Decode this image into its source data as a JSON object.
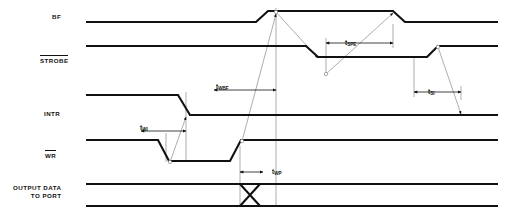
{
  "diagram": {
    "kind": "timing-diagram",
    "title": "",
    "width": 508,
    "height": 218,
    "colors": {
      "signal": "#111111",
      "reference": "#8a8a8a",
      "background": "#ffffff"
    },
    "signals": [
      {
        "id": "bf",
        "label": "BF",
        "overbar": false,
        "label_x": 52,
        "label_y": 13,
        "baseline": 22,
        "high": 11
      },
      {
        "id": "strobe",
        "label": "STROBE",
        "overbar": true,
        "label_x": 40,
        "label_y": 55,
        "baseline": 46,
        "high": 46
      },
      {
        "id": "intr",
        "label": "INTR",
        "overbar": false,
        "label_x": 44,
        "label_y": 110,
        "baseline": 115,
        "high": 95
      },
      {
        "id": "wr",
        "label": "WR",
        "overbar": true,
        "label_x": 45,
        "label_y": 150,
        "baseline": 140,
        "high": 140
      },
      {
        "id": "data",
        "label": "OUTPUT DATA\nTO PORT",
        "overbar": false,
        "label_x": 13,
        "label_y": 184,
        "baseline": 196,
        "high": 184
      }
    ],
    "timing_marks": [
      {
        "id": "t-wi",
        "text": "t",
        "sub": "WI",
        "x": 140,
        "y": 124,
        "arrow_x1": 141,
        "arrow_x2": 186,
        "arrow_y": 131
      },
      {
        "id": "t-wbf",
        "text": "t",
        "sub": "WBF",
        "x": 216,
        "y": 83,
        "arrow_x1": 214,
        "arrow_x2": 276,
        "arrow_y": 90
      },
      {
        "id": "t-spe",
        "text": "t",
        "sub": "SPE",
        "x": 345,
        "y": 39,
        "arrow_x1": 326,
        "arrow_x2": 393,
        "arrow_y": 43
      },
      {
        "id": "t-si",
        "text": "t",
        "sub": "SI",
        "x": 428,
        "y": 88,
        "arrow_x1": 414,
        "arrow_x2": 461,
        "arrow_y": 92
      },
      {
        "id": "t-wp",
        "text": "t",
        "sub": "WP",
        "x": 272,
        "y": 168,
        "arrow_x1": 240,
        "arrow_x2": 263,
        "arrow_y": 172
      }
    ],
    "reference_lines": [
      {
        "id": "ref-wr-fall",
        "x": 166,
        "y1": 133,
        "y2": 162
      },
      {
        "id": "ref-intr-fall",
        "x": 186,
        "y1": 92,
        "y2": 160
      },
      {
        "id": "ref-wr-rise",
        "x": 240,
        "y1": 146,
        "y2": 206
      },
      {
        "id": "ref-bf-rise",
        "x": 276,
        "y1": 8,
        "y2": 206
      },
      {
        "id": "ref-strobe-low",
        "x": 326,
        "y1": 38,
        "y2": 75
      },
      {
        "id": "ref-bf-fall",
        "x": 393,
        "y1": 24,
        "y2": 48
      },
      {
        "id": "ref-strobe-hi",
        "x": 414,
        "y1": 56,
        "y2": 97
      },
      {
        "id": "ref-intr-rise",
        "x": 461,
        "y1": 86,
        "y2": 100
      }
    ],
    "waveforms": {
      "bf": "M 86,22 L 256,22 L 268,11 L 393,11 L 405,22 L 498,22",
      "strobe": "M 86,46 L 306,46 L 318,57 L 427,57 L 438,46 L 498,46",
      "intr": "M 86,95 L 178,95 L 190,115 L 498,115",
      "wr": "M 86,140 L 158,140 L 169,161 L 230,161 L 241,140 L 498,140",
      "data_top": "M 86,184 L 498,184",
      "data_bottom": "M 86,206 L 498,206",
      "data_cross": "M 240,184 L 250,195 L 240,206 M 250,195 L 260,184 M 250,195 L 260,206"
    },
    "causal_arrows": [
      {
        "id": "arrow-wr-to-intr",
        "path": "M 170,162 L 186,117"
      },
      {
        "id": "arrow-wr-to-bf",
        "path": "M 242,141 L 276,14"
      },
      {
        "id": "arrow-bf-to-strobe",
        "path": "M 276,12 L 318,58"
      },
      {
        "id": "arrow-strobe-to-bf",
        "path": "M 326,74 L 393,13"
      },
      {
        "id": "arrow-strobe-to-intr",
        "path": "M 438,47 L 461,114"
      }
    ]
  }
}
